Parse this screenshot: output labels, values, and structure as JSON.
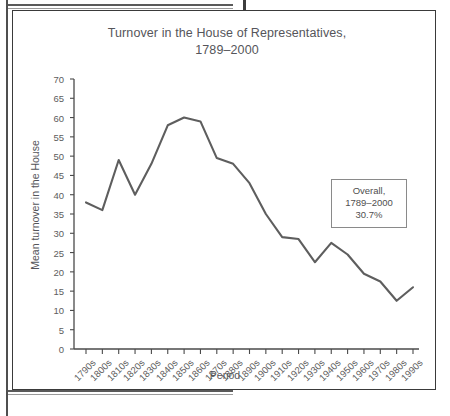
{
  "figure": {
    "title": "Turnover in the House of Representatives,\n1789–2000",
    "callout": {
      "line1": "Overall,",
      "line2": "1789–2000",
      "line3": "30.7%"
    },
    "line_color": "#5e5e5e",
    "axis_color": "#4a4a4a",
    "text_color": "#55555a"
  },
  "chart_data": {
    "type": "line",
    "title": "Turnover in the House of Representatives, 1789–2000",
    "xlabel": "Period",
    "ylabel": "Mean turnover in the House",
    "xlim_categories": 21,
    "ylim": [
      0,
      70
    ],
    "ytick_step": 5,
    "yticks": [
      0,
      5,
      10,
      15,
      20,
      25,
      30,
      35,
      40,
      45,
      50,
      55,
      60,
      65,
      70
    ],
    "grid": false,
    "legend": null,
    "annotations": [
      {
        "text": "Overall, 1789–2000 30.7%",
        "position": "right-middle"
      }
    ],
    "categories": [
      "1790s",
      "1800s",
      "1810s",
      "1820s",
      "1830s",
      "1840s",
      "1850s",
      "1860s",
      "1870s",
      "1880s",
      "1890s",
      "1900s",
      "1910s",
      "1920s",
      "1930s",
      "1940s",
      "1950s",
      "1960s",
      "1970s",
      "1980s",
      "1990s"
    ],
    "values": [
      38.0,
      36.0,
      49.0,
      40.0,
      48.0,
      58.0,
      60.0,
      59.0,
      49.5,
      48.0,
      43.0,
      35.0,
      29.0,
      28.5,
      22.5,
      27.5,
      24.5,
      19.5,
      17.5,
      12.5,
      16.0
    ]
  }
}
